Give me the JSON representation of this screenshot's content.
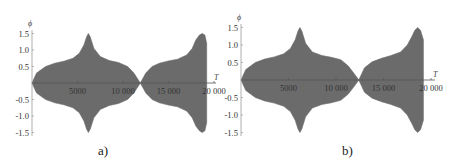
{
  "chart_data": [
    {
      "type": "area",
      "panel_label": "a)",
      "title": "",
      "xlabel": "T",
      "ylabel": "ϕ",
      "xlim": [
        0,
        20500
      ],
      "ylim": [
        -1.6,
        1.6
      ],
      "x_ticks": [
        5000,
        10000,
        15000,
        20000
      ],
      "x_tick_labels": [
        "5000",
        "10 000",
        "15 000",
        "20 000"
      ],
      "y_ticks": [
        -1.5,
        -1.0,
        -0.5,
        0.5,
        1.0,
        1.5
      ],
      "y_tick_labels": [
        "-1.5",
        "-1.0",
        "-0.5",
        "0.5",
        "1.0",
        "1.5"
      ],
      "grid": false,
      "fill_color": "#6b6b6b",
      "description": "Symmetric envelope of oscillation amplitude phi vs T; envelope grows from 0, plateaus near 0.6-0.7, peaks at 1.5 near T≈6200, returns to 0 at T≈11900; second lobe grows to 1.5 at T≈18700 then truncates at T≈19200",
      "envelope": {
        "x": [
          0,
          500,
          1500,
          2500,
          3500,
          4500,
          5200,
          5700,
          6000,
          6200,
          6400,
          6800,
          7500,
          8500,
          9500,
          10500,
          11200,
          11900,
          12500,
          13200,
          14000,
          15000,
          16000,
          17000,
          17600,
          18000,
          18400,
          18700,
          19000,
          19200
        ],
        "upper": [
          0,
          0.3,
          0.5,
          0.6,
          0.66,
          0.75,
          0.9,
          1.15,
          1.4,
          1.5,
          1.4,
          1.05,
          0.8,
          0.68,
          0.62,
          0.5,
          0.3,
          0,
          0.3,
          0.5,
          0.6,
          0.67,
          0.72,
          0.85,
          1.05,
          1.3,
          1.45,
          1.5,
          1.45,
          1.2
        ],
        "lower": [
          0,
          -0.3,
          -0.5,
          -0.6,
          -0.66,
          -0.75,
          -0.9,
          -1.15,
          -1.4,
          -1.5,
          -1.4,
          -1.05,
          -0.8,
          -0.68,
          -0.62,
          -0.5,
          -0.3,
          0,
          -0.3,
          -0.5,
          -0.6,
          -0.67,
          -0.72,
          -0.85,
          -1.05,
          -1.3,
          -1.45,
          -1.5,
          -1.45,
          -1.2
        ]
      }
    },
    {
      "type": "area",
      "panel_label": "b)",
      "title": "",
      "xlabel": "T",
      "ylabel": "ϕ",
      "xlim": [
        0,
        20500
      ],
      "ylim": [
        -1.6,
        1.6
      ],
      "x_ticks": [
        5000,
        10000,
        15000,
        20000
      ],
      "x_tick_labels": [
        "5000",
        "10 000",
        "15 000",
        "20 000"
      ],
      "y_ticks": [
        -1.5,
        -1.0,
        -0.5,
        0.5,
        1.0,
        1.5
      ],
      "y_tick_labels": [
        "-1.5",
        "-1.0",
        "-0.5",
        "0.5",
        "1.0",
        "1.5"
      ],
      "grid": false,
      "fill_color": "#6b6b6b",
      "description": "Symmetric envelope of phi vs T; first lobe peaks at 1.5 near T≈6200 and returns to 0 at T≈12400; second lobe peaks at 1.5 near T≈18600 and truncates at T≈19200",
      "envelope": {
        "x": [
          0,
          500,
          1500,
          2500,
          3500,
          4500,
          5200,
          5700,
          6000,
          6200,
          6400,
          6800,
          7500,
          8500,
          9500,
          10500,
          11300,
          12000,
          12400,
          13000,
          13800,
          14800,
          15800,
          16800,
          17500,
          18000,
          18300,
          18600,
          18900,
          19200
        ],
        "upper": [
          0,
          0.3,
          0.5,
          0.6,
          0.66,
          0.75,
          0.9,
          1.15,
          1.4,
          1.5,
          1.4,
          1.05,
          0.8,
          0.7,
          0.65,
          0.58,
          0.4,
          0.15,
          0,
          0.35,
          0.52,
          0.62,
          0.7,
          0.8,
          1.0,
          1.25,
          1.42,
          1.5,
          1.42,
          1.15
        ],
        "lower": [
          0,
          -0.3,
          -0.5,
          -0.6,
          -0.66,
          -0.75,
          -0.9,
          -1.15,
          -1.4,
          -1.5,
          -1.4,
          -1.05,
          -0.8,
          -0.7,
          -0.65,
          -0.58,
          -0.4,
          -0.15,
          0,
          -0.35,
          -0.52,
          -0.62,
          -0.7,
          -0.8,
          -1.0,
          -1.25,
          -1.42,
          -1.5,
          -1.42,
          -1.15
        ]
      }
    }
  ],
  "panels": {
    "a": {
      "caption": "a)"
    },
    "b": {
      "caption": "b)"
    }
  }
}
